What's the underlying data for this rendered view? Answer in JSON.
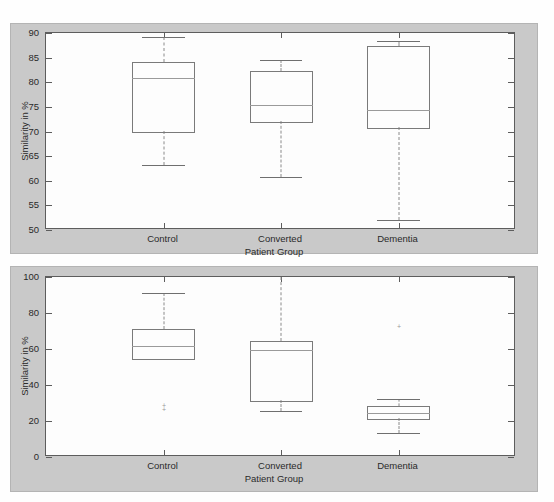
{
  "scan_caption": "",
  "figures": [
    {
      "id": "top",
      "ylabel": "Similarity in %",
      "xlabel": "Patient Group",
      "yticks": [
        50,
        55,
        60,
        65,
        70,
        75,
        80,
        85,
        90
      ],
      "categories": [
        "Control",
        "Converted",
        "Dementia"
      ]
    },
    {
      "id": "bottom",
      "ylabel": "Similarity in %",
      "xlabel": "Patient Group",
      "yticks": [
        0,
        20,
        40,
        60,
        80,
        100
      ],
      "categories": [
        "Control",
        "Converted",
        "Dementia"
      ]
    }
  ],
  "chart_data": [
    {
      "type": "box",
      "title": "",
      "xlabel": "Patient Group",
      "ylabel": "Similarity in %",
      "ylim": [
        50,
        90
      ],
      "ytick_step": 5,
      "grid": false,
      "categories": [
        "Control",
        "Converted",
        "Dementia"
      ],
      "boxes": [
        {
          "category": "Control",
          "whisker_low": 63.2,
          "q1": 70.1,
          "median": 80.9,
          "q3": 84.2,
          "whisker_high": 89.2,
          "outliers": []
        },
        {
          "category": "Converted",
          "whisker_low": 60.7,
          "q1": 72.1,
          "median": 75.4,
          "q3": 82.3,
          "whisker_high": 84.6,
          "outliers": []
        },
        {
          "category": "Dementia",
          "whisker_low": 52.1,
          "q1": 70.9,
          "median": 74.3,
          "q3": 87.4,
          "whisker_high": 88.4,
          "outliers": []
        }
      ]
    },
    {
      "type": "box",
      "title": "",
      "xlabel": "Patient Group",
      "ylabel": "Similarity in %",
      "ylim": [
        0,
        100
      ],
      "ytick_step": 20,
      "grid": false,
      "categories": [
        "Control",
        "Converted",
        "Dementia"
      ],
      "boxes": [
        {
          "category": "Control",
          "whisker_low": 54.8,
          "q1": 54.8,
          "median": 61.7,
          "q3": 71.3,
          "whisker_high": 91.0,
          "outliers": [
            27.5,
            25.3
          ]
        },
        {
          "category": "Converted",
          "whisker_low": 25.5,
          "q1": 31.8,
          "median": 59.6,
          "q3": 64.4,
          "whisker_high": 100.0,
          "outliers": []
        },
        {
          "category": "Dementia",
          "whisker_low": 13.2,
          "q1": 21.8,
          "median": 24.3,
          "q3": 28.4,
          "whisker_high": 32.4,
          "outliers": [
            71.2
          ]
        }
      ]
    }
  ]
}
